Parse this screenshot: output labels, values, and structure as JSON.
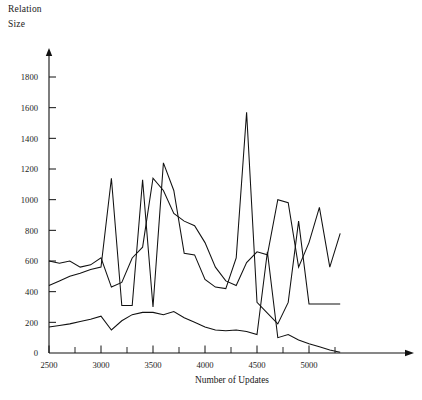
{
  "axis_titles": {
    "y_line1": "Relation",
    "y_line2": "Size",
    "x": "Number of Updates"
  },
  "chart_data": {
    "type": "line",
    "title": "",
    "xlabel": "Number of Updates",
    "ylabel": "Relation Size",
    "xlim": [
      2500,
      5350
    ],
    "ylim": [
      0,
      1900
    ],
    "xticks": [
      2500,
      3000,
      3500,
      4000,
      4500,
      5000
    ],
    "xticks_minor": [
      2750,
      3250,
      3750,
      4250,
      4750,
      5250
    ],
    "yticks": [
      0,
      200,
      400,
      600,
      800,
      1000,
      1200,
      1400,
      1600,
      1800
    ],
    "grid": false,
    "legend": "none",
    "line_color": "#111111",
    "series": [
      {
        "name": "series-a",
        "x": [
          2500,
          2600,
          2700,
          2800,
          2900,
          3000,
          3100,
          3200,
          3300,
          3400,
          3500,
          3600,
          3700,
          3800,
          3900,
          4000,
          4100,
          4200,
          4300,
          4400,
          4500,
          4600,
          4700,
          4800,
          4900,
          5000,
          5100,
          5200,
          5300
        ],
        "values": [
          600,
          585,
          600,
          560,
          575,
          620,
          430,
          460,
          620,
          690,
          1140,
          1060,
          910,
          860,
          830,
          720,
          560,
          470,
          440,
          590,
          660,
          640,
          1000,
          980,
          560,
          720,
          950,
          560,
          780
        ]
      },
      {
        "name": "series-b",
        "x": [
          2500,
          2600,
          2700,
          2800,
          2900,
          3000,
          3100,
          3200,
          3300,
          3400,
          3500,
          3600,
          3700,
          3800,
          3900,
          4000,
          4100,
          4200,
          4300,
          4400,
          4500,
          4600,
          4700,
          4800,
          4900,
          5000,
          5100,
          5200,
          5300
        ],
        "values": [
          440,
          470,
          500,
          520,
          545,
          560,
          1140,
          310,
          310,
          1130,
          300,
          1240,
          1060,
          650,
          640,
          480,
          430,
          420,
          620,
          1570,
          330,
          260,
          190,
          330,
          860,
          320,
          320,
          320,
          320
        ]
      },
      {
        "name": "series-c",
        "x": [
          2500,
          2600,
          2700,
          2800,
          2900,
          3000,
          3100,
          3200,
          3300,
          3400,
          3500,
          3600,
          3700,
          3800,
          3900,
          4000,
          4100,
          4200,
          4300,
          4400,
          4500,
          4600,
          4700,
          4800,
          4900,
          5000,
          5100,
          5200,
          5300
        ],
        "values": [
          170,
          180,
          190,
          205,
          220,
          240,
          150,
          210,
          250,
          265,
          265,
          250,
          270,
          230,
          200,
          170,
          150,
          145,
          150,
          140,
          120,
          660,
          100,
          120,
          85,
          60,
          40,
          20,
          5
        ]
      }
    ]
  }
}
